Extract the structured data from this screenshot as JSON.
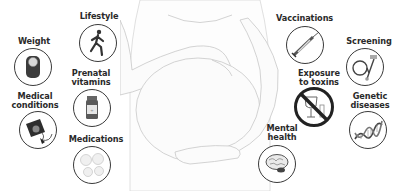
{
  "diagram": {
    "center_figure": "pregnant-woman-holding-belly",
    "items": [
      {
        "id": "weight",
        "label": "Weight",
        "icon": "scale-icon"
      },
      {
        "id": "lifestyle",
        "label": "Lifestyle",
        "icon": "runner-icon"
      },
      {
        "id": "prenatal_vitamins",
        "label_line1": "Prenatal",
        "label_line2": "vitamins",
        "icon": "pill-bottle-icon"
      },
      {
        "id": "medical_conditions",
        "label_line1": "Medical",
        "label_line2": "conditions",
        "icon": "blood-pressure-cuff-icon"
      },
      {
        "id": "medications",
        "label": "Medications",
        "icon": "tablets-icon"
      },
      {
        "id": "vaccinations",
        "label": "Vaccinations",
        "icon": "syringe-icon"
      },
      {
        "id": "screening",
        "label": "Screening",
        "icon": "stethoscope-icon"
      },
      {
        "id": "exposure_to_toxins",
        "label_line1": "Exposure",
        "label_line2": "to toxins",
        "icon": "no-alcohol-icon"
      },
      {
        "id": "genetic_diseases",
        "label_line1": "Genetic",
        "label_line2": "diseases",
        "icon": "dna-icon"
      },
      {
        "id": "mental_health",
        "label_line1": "Mental",
        "label_line2": "health",
        "icon": "brain-icon"
      }
    ]
  }
}
